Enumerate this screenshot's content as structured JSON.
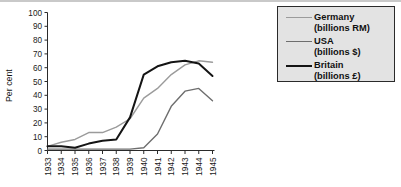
{
  "chart_data": {
    "type": "line",
    "title": "",
    "xlabel": "",
    "ylabel": "Per cent",
    "x": [
      "1933",
      "1934",
      "1935",
      "1936",
      "1937",
      "1938",
      "1939",
      "1940",
      "1941",
      "1942",
      "1943",
      "1944",
      "1945"
    ],
    "xlim": [
      1933,
      1945
    ],
    "ylim": [
      0,
      100
    ],
    "yticks": [
      0,
      10,
      20,
      30,
      40,
      50,
      60,
      70,
      80,
      90,
      100
    ],
    "ytick_labels": [
      "0",
      "10",
      "20",
      "30",
      "40",
      "50",
      "60",
      "70",
      "80",
      "90",
      "100"
    ],
    "grid": false,
    "legend_position": "top-right",
    "series": [
      {
        "name": "Germany",
        "unit": "(billions RM)",
        "color": "#9b9b9b",
        "width": 1.4,
        "values": [
          3,
          6,
          8,
          13,
          13,
          17,
          23,
          38,
          45,
          55,
          62,
          65,
          64
        ]
      },
      {
        "name": "USA",
        "unit": "(billions $)",
        "color": "#6e6e6e",
        "width": 1.4,
        "values": [
          1,
          1,
          1,
          1,
          1,
          1,
          1,
          2,
          12,
          32,
          43,
          45,
          36
        ]
      },
      {
        "name": "Britain",
        "unit": "(billions £)",
        "color": "#141414",
        "width": 2.0,
        "values": [
          3,
          3,
          2,
          5,
          7,
          8,
          24,
          55,
          61,
          64,
          65,
          63,
          54
        ]
      }
    ]
  },
  "legend": {
    "items": [
      {
        "label": "Germany",
        "sublabel": "(billions RM)",
        "color": "#9b9b9b",
        "width": 1.4
      },
      {
        "label": "USA",
        "sublabel": "(billions $)",
        "color": "#6e6e6e",
        "width": 1.4
      },
      {
        "label": "Britain",
        "sublabel": "(billions £)",
        "color": "#141414",
        "width": 2.0
      }
    ]
  },
  "axes": {
    "y_axis_title": "Per cent"
  }
}
